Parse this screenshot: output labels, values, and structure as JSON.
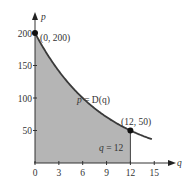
{
  "chart_data": {
    "type": "area",
    "title": "",
    "xlabel": "q",
    "ylabel": "p",
    "xlim": [
      0,
      15.5
    ],
    "ylim": [
      0,
      215
    ],
    "x_ticks": [
      0,
      3,
      6,
      9,
      12,
      15
    ],
    "y_ticks": [
      50,
      100,
      150,
      200
    ],
    "grid": false,
    "legend": null,
    "curve": {
      "label": "p = D(q)",
      "formula": "p = 200 * exp(-(ln 4 / 12) * q)",
      "x": [
        0,
        1,
        2,
        3,
        4,
        5,
        6,
        7,
        8,
        9,
        10,
        11,
        12,
        13,
        14,
        14.7
      ],
      "y": [
        200,
        178.2,
        158.7,
        141.4,
        126.0,
        112.2,
        100,
        89.1,
        79.4,
        70.7,
        63.0,
        56.1,
        50,
        44.5,
        39.7,
        36.7
      ]
    },
    "shaded_region": {
      "from_q": 0,
      "to_q": 12,
      "under": "p = D(q)",
      "color": "#b8b8b8"
    },
    "points": [
      {
        "q": 0,
        "p": 200,
        "label": "(0, 200)"
      },
      {
        "q": 12,
        "p": 50,
        "label": "(12, 50)"
      }
    ],
    "vertical_line": {
      "q": 12,
      "label": "q = 12"
    }
  },
  "labels": {
    "x_axis": "q",
    "y_axis": "p",
    "x_ticks": [
      "0",
      "3",
      "6",
      "9",
      "12",
      "15"
    ],
    "y_ticks": [
      "50",
      "100",
      "150",
      "200"
    ],
    "curve_label_left": "p",
    "curve_label_mid": " = ",
    "curve_label_right": "D(q)",
    "point_a": "(0, 200)",
    "point_b": "(12, 50)",
    "vline_q": "q",
    "vline_rest": " = 12"
  },
  "colors": {
    "shade": "#b5b5b5",
    "curve": "#3a3a3a",
    "axis": "#333333"
  }
}
